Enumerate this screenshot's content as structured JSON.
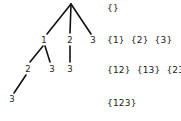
{
  "diagram": {
    "tree": {
      "nodes": {
        "n1": "1",
        "n2": "2",
        "n3": "3",
        "n1_2": "2",
        "n1_3": "3",
        "n2_3": "3",
        "n1_2_3": "3"
      }
    },
    "subset_rows": [
      {
        "items": [
          "{}"
        ]
      },
      {
        "items": [
          "{1}",
          "{2}",
          "{3}"
        ]
      },
      {
        "items": [
          "{12}",
          "{13}",
          "{23}"
        ]
      },
      {
        "items": [
          "{123}"
        ]
      }
    ],
    "colors": {
      "background": "#ffffff",
      "line": "#111111",
      "text": "#1a1a1a"
    }
  }
}
